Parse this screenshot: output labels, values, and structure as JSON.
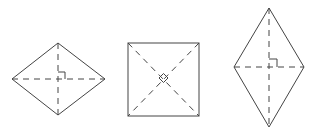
{
  "figure": {
    "colors": {
      "stroke": "#444444",
      "background": "#ffffff"
    },
    "shapes": [
      {
        "name": "wide-rhombus",
        "vertices": [
          [
            58,
            43
          ],
          [
            105,
            79
          ],
          [
            58,
            115
          ],
          [
            12,
            79
          ]
        ],
        "diagonals": [
          [
            [
              12,
              79
            ],
            [
              105,
              79
            ]
          ],
          [
            [
              58,
              43
            ],
            [
              58,
              115
            ]
          ]
        ],
        "right_angle_mark": "square"
      },
      {
        "name": "square",
        "vertices": [
          [
            128,
            43
          ],
          [
            199,
            43
          ],
          [
            199,
            116
          ],
          [
            128,
            116
          ]
        ],
        "diagonals": [
          [
            [
              128,
              43
            ],
            [
              199,
              116
            ]
          ],
          [
            [
              199,
              43
            ],
            [
              128,
              116
            ]
          ]
        ],
        "right_angle_mark": "diamond"
      },
      {
        "name": "tall-rhombus",
        "vertices": [
          [
            269,
            8
          ],
          [
            304,
            67
          ],
          [
            269,
            127
          ],
          [
            234,
            67
          ]
        ],
        "diagonals": [
          [
            [
              234,
              67
            ],
            [
              304,
              67
            ]
          ],
          [
            [
              269,
              8
            ],
            [
              269,
              127
            ]
          ]
        ],
        "right_angle_mark": "square"
      }
    ]
  }
}
